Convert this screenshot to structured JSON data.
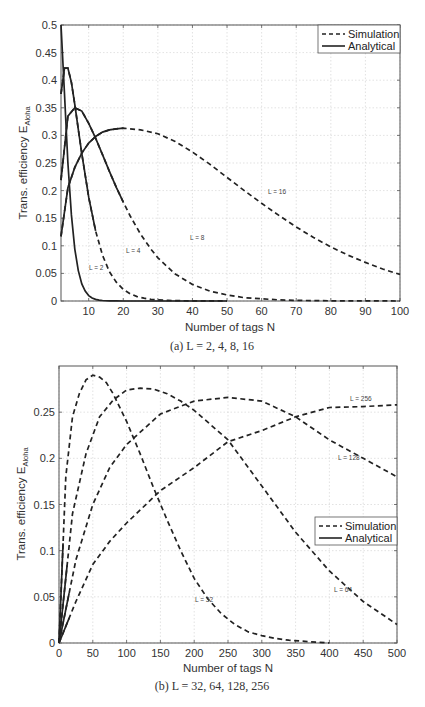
{
  "chart_data": [
    {
      "id": "a",
      "type": "line",
      "caption": "(a) L = 2, 4, 8, 16",
      "xlabel": "Number of tags N",
      "ylabel": "Trans. efficiency E_Aloha",
      "xlim": [
        2,
        100
      ],
      "ylim": [
        0,
        0.5
      ],
      "xticks": [
        10,
        20,
        30,
        40,
        50,
        60,
        70,
        80,
        90,
        100
      ],
      "yticks": [
        0,
        0.05,
        0.1,
        0.15,
        0.2,
        0.25,
        0.3,
        0.35,
        0.4,
        0.45,
        0.5
      ],
      "grid": true,
      "legend": {
        "position": "top-right",
        "entries": [
          "Simulation",
          "Analytical"
        ]
      },
      "series": [
        {
          "name": "L=2",
          "label": "L = 2",
          "style": "solid",
          "x": [
            2,
            3,
            4,
            5,
            6,
            7,
            8,
            9,
            10,
            11,
            12,
            13,
            14,
            16,
            18,
            20,
            25,
            30,
            40,
            50
          ],
          "y": [
            0.5,
            0.375,
            0.25,
            0.156,
            0.094,
            0.055,
            0.031,
            0.018,
            0.0098,
            0.0054,
            0.0029,
            0.0016,
            0.0009,
            0.0002,
            0.0001,
            0,
            0,
            0,
            0,
            0
          ]
        },
        {
          "name": "L=4",
          "label": "L = 4",
          "style": "solid-then-dashed",
          "x": [
            2,
            3,
            4,
            5,
            6,
            7,
            8,
            10,
            12,
            14,
            16,
            18,
            20,
            22,
            24,
            26,
            28,
            30,
            33,
            36,
            40,
            45,
            50
          ],
          "y": [
            0.375,
            0.422,
            0.422,
            0.396,
            0.356,
            0.311,
            0.267,
            0.188,
            0.127,
            0.083,
            0.053,
            0.034,
            0.021,
            0.013,
            0.008,
            0.005,
            0.003,
            0.002,
            0.001,
            0.0005,
            0.0002,
            0.0001,
            0
          ]
        },
        {
          "name": "L=8",
          "label": "L = 8",
          "style": "solid-then-dashed",
          "x": [
            2,
            4,
            6,
            8,
            10,
            12,
            14,
            16,
            18,
            20,
            22,
            25,
            28,
            30,
            35,
            40,
            45,
            50,
            55,
            60,
            65,
            70,
            80,
            90,
            100
          ],
          "y": [
            0.219,
            0.335,
            0.35,
            0.344,
            0.322,
            0.295,
            0.265,
            0.235,
            0.206,
            0.179,
            0.154,
            0.121,
            0.094,
            0.078,
            0.049,
            0.03,
            0.018,
            0.011,
            0.006,
            0.004,
            0.002,
            0.001,
            0.0004,
            0.0001,
            0
          ]
        },
        {
          "name": "L=16",
          "label": "L = 16",
          "style": "solid-then-dashed",
          "x": [
            2,
            4,
            6,
            8,
            10,
            12,
            14,
            16,
            18,
            20,
            25,
            30,
            35,
            40,
            45,
            50,
            55,
            60,
            65,
            70,
            75,
            80,
            85,
            90,
            95,
            100
          ],
          "y": [
            0.117,
            0.205,
            0.242,
            0.268,
            0.286,
            0.298,
            0.306,
            0.31,
            0.312,
            0.313,
            0.31,
            0.303,
            0.289,
            0.27,
            0.248,
            0.224,
            0.2,
            0.177,
            0.155,
            0.134,
            0.115,
            0.098,
            0.083,
            0.07,
            0.058,
            0.048
          ]
        }
      ]
    },
    {
      "id": "b",
      "type": "line",
      "caption": "(b) L = 32, 64, 128, 256",
      "xlabel": "Number of tags N",
      "ylabel": "Trans. efficiency E_Aloha",
      "xlim": [
        0,
        500
      ],
      "ylim": [
        0,
        0.3
      ],
      "xticks": [
        0,
        50,
        100,
        150,
        200,
        250,
        300,
        350,
        400,
        450,
        500
      ],
      "yticks": [
        0,
        0.05,
        0.1,
        0.15,
        0.2,
        0.25
      ],
      "grid": true,
      "legend": {
        "position": "right-middle",
        "entries": [
          "Simulation",
          "Analytical"
        ]
      },
      "series": [
        {
          "name": "L=32",
          "label": "L = 32",
          "style": "dashed",
          "x": [
            0,
            10,
            20,
            30,
            40,
            50,
            60,
            70,
            80,
            100,
            120,
            140,
            160,
            180,
            200,
            220,
            240,
            260,
            280,
            300,
            320,
            340,
            360,
            380,
            400
          ],
          "y": [
            0,
            0.18,
            0.245,
            0.27,
            0.285,
            0.29,
            0.288,
            0.282,
            0.27,
            0.24,
            0.205,
            0.168,
            0.133,
            0.1,
            0.07,
            0.048,
            0.032,
            0.02,
            0.012,
            0.008,
            0.005,
            0.003,
            0.002,
            0.001,
            0
          ]
        },
        {
          "name": "L=64",
          "label": "L = 64",
          "style": "dashed",
          "x": [
            0,
            20,
            40,
            60,
            80,
            100,
            120,
            140,
            160,
            180,
            200,
            250,
            300,
            350,
            400,
            450,
            500
          ],
          "y": [
            0,
            0.14,
            0.205,
            0.245,
            0.263,
            0.274,
            0.276,
            0.275,
            0.27,
            0.262,
            0.252,
            0.22,
            0.17,
            0.12,
            0.078,
            0.045,
            0.02
          ]
        },
        {
          "name": "L=128",
          "label": "L = 128",
          "style": "dashed",
          "x": [
            0,
            25,
            50,
            75,
            100,
            150,
            200,
            250,
            300,
            350,
            400,
            450,
            500
          ],
          "y": [
            0,
            0.09,
            0.15,
            0.19,
            0.215,
            0.248,
            0.262,
            0.266,
            0.262,
            0.245,
            0.22,
            0.2,
            0.18
          ]
        },
        {
          "name": "L=256",
          "label": "L = 256",
          "style": "dashed",
          "x": [
            0,
            25,
            50,
            75,
            100,
            150,
            200,
            250,
            300,
            350,
            400,
            450,
            500
          ],
          "y": [
            0,
            0.045,
            0.085,
            0.11,
            0.13,
            0.165,
            0.19,
            0.218,
            0.23,
            0.245,
            0.255,
            0.256,
            0.258
          ]
        }
      ]
    }
  ],
  "legend": {
    "simulation": "Simulation",
    "analytical": "Analytical"
  },
  "plot_a": {
    "xlabel": "Number of tags N",
    "ylabel_main": "Trans. efficiency E",
    "ylabel_sub": "Aloha",
    "caption": "(a) L = 2, 4, 8, 16",
    "yticks": [
      "0",
      "0.05",
      "0.1",
      "0.15",
      "0.2",
      "0.25",
      "0.3",
      "0.35",
      "0.4",
      "0.45",
      "0.5"
    ],
    "xticks": [
      "10",
      "20",
      "30",
      "40",
      "50",
      "60",
      "70",
      "80",
      "90",
      "100"
    ],
    "labels": {
      "l2": "L = 2",
      "l4": "L = 4",
      "l8": "L = 8",
      "l16": "L = 16"
    }
  },
  "plot_b": {
    "xlabel": "Number of tags N",
    "ylabel_main": "Trans. efficiency E",
    "ylabel_sub": "Aloha",
    "caption": "(b) L = 32, 64, 128, 256",
    "yticks": [
      "0",
      "0.05",
      "0.1",
      "0.15",
      "0.2",
      "0.25"
    ],
    "xticks": [
      "0",
      "50",
      "100",
      "150",
      "200",
      "250",
      "300",
      "350",
      "400",
      "450",
      "500"
    ],
    "labels": {
      "l32": "L = 32",
      "l64": "L = 64",
      "l128": "L = 128",
      "l256": "L = 256"
    }
  }
}
